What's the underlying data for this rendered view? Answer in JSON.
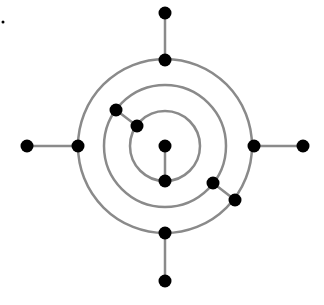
{
  "diagram": {
    "type": "concentric-circle-graph",
    "center": [
      165,
      146
    ],
    "colors": {
      "edge": "#8a8a8a",
      "node": "#000000",
      "background": "#ffffff"
    },
    "circles": [
      {
        "id": "inner",
        "r": 35
      },
      {
        "id": "middle",
        "r": 61
      },
      {
        "id": "outer",
        "r": 87
      }
    ],
    "nodes": [
      {
        "id": "center",
        "x": 165,
        "y": 146
      },
      {
        "id": "inner-bottom",
        "x": 165,
        "y": 181
      },
      {
        "id": "inner-upper-left",
        "x": 137,
        "y": 126
      },
      {
        "id": "middle-upper-left",
        "x": 116,
        "y": 110
      },
      {
        "id": "middle-lower-right",
        "x": 213,
        "y": 183
      },
      {
        "id": "outer-lower-right",
        "x": 235,
        "y": 200
      },
      {
        "id": "outer-top",
        "x": 165,
        "y": 60
      },
      {
        "id": "outer-left",
        "x": 78,
        "y": 146
      },
      {
        "id": "outer-right",
        "x": 254,
        "y": 146
      },
      {
        "id": "outer-bottom",
        "x": 165,
        "y": 233
      },
      {
        "id": "end-top",
        "x": 165,
        "y": 13
      },
      {
        "id": "end-left",
        "x": 27,
        "y": 146
      },
      {
        "id": "end-right",
        "x": 303,
        "y": 146
      },
      {
        "id": "end-bottom",
        "x": 165,
        "y": 281
      }
    ],
    "edges": [
      [
        "center",
        "inner-bottom"
      ],
      [
        "inner-upper-left",
        "middle-upper-left"
      ],
      [
        "middle-lower-right",
        "outer-lower-right"
      ],
      [
        "outer-top",
        "end-top"
      ],
      [
        "outer-left",
        "end-left"
      ],
      [
        "outer-right",
        "end-right"
      ],
      [
        "outer-bottom",
        "end-bottom"
      ]
    ],
    "stray_dot": {
      "x": 3,
      "y": 22,
      "r": 1.5
    }
  }
}
